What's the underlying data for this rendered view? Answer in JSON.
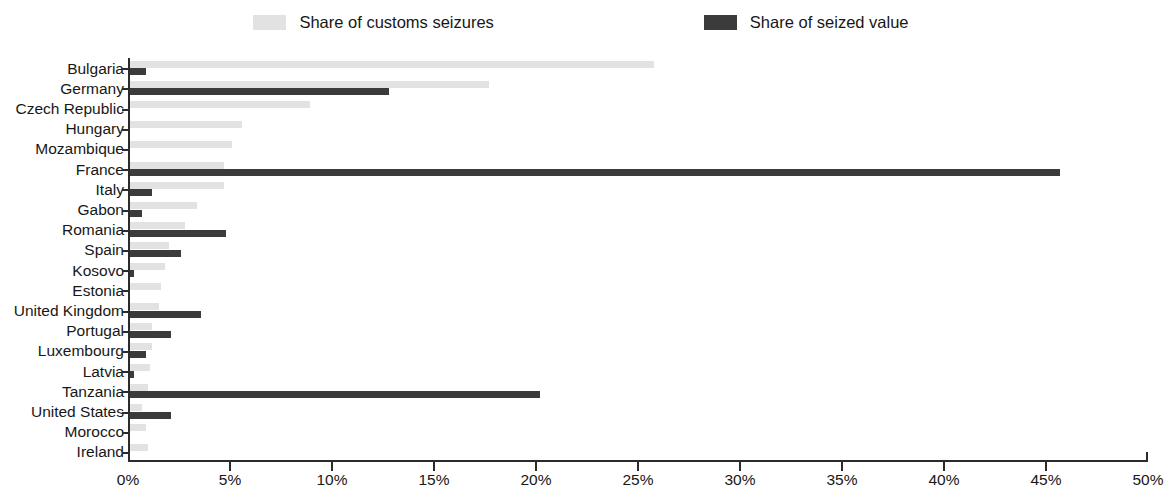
{
  "chart_data": {
    "type": "bar",
    "orientation": "horizontal",
    "title": "",
    "subtitle": "",
    "xlabel": "",
    "ylabel": "",
    "xlim": [
      0,
      50
    ],
    "xunit": "%",
    "grid": false,
    "legend_position": "top",
    "xticks": [
      "0%",
      "5%",
      "10%",
      "15%",
      "20%",
      "25%",
      "30%",
      "35%",
      "40%",
      "45%",
      "50%"
    ],
    "xtick_values": [
      0,
      5,
      10,
      15,
      20,
      25,
      30,
      35,
      40,
      45,
      50
    ],
    "categories": [
      "Bulgaria",
      "Germany",
      "Czech Republic",
      "Hungary",
      "Mozambique",
      "France",
      "Italy",
      "Gabon",
      "Romania",
      "Spain",
      "Kosovo",
      "Estonia",
      "United Kingdom",
      "Portugal",
      "Luxembourg",
      "Latvia",
      "Tanzania",
      "United States",
      "Morocco",
      "Ireland"
    ],
    "series": [
      {
        "name": "Share of customs seizures",
        "color": "#e2e2e2",
        "values": [
          25.7,
          17.6,
          8.8,
          5.5,
          5.0,
          4.6,
          4.6,
          3.3,
          2.7,
          1.9,
          1.7,
          1.5,
          1.4,
          1.1,
          1.1,
          1.0,
          0.9,
          0.6,
          0.8,
          0.9
        ]
      },
      {
        "name": "Share of seized value",
        "color": "#3b3b3b",
        "values": [
          0.8,
          12.7,
          0.0,
          0.0,
          0.0,
          45.6,
          1.1,
          0.6,
          4.7,
          2.5,
          0.2,
          0.0,
          3.5,
          2.0,
          0.8,
          0.2,
          20.1,
          2.0,
          0.0,
          0.0
        ]
      }
    ]
  },
  "legend": {
    "entries": [
      {
        "label": "Share of customs seizures",
        "swatch": "light-gray-swatch"
      },
      {
        "label": "Share of seized value",
        "swatch": "dark-gray-swatch"
      }
    ]
  },
  "colors": {
    "light_bar": "#e2e2e2",
    "dark_bar": "#3b3b3b",
    "axis": "#2b2b2b",
    "text": "#171717",
    "background": "#ffffff"
  }
}
